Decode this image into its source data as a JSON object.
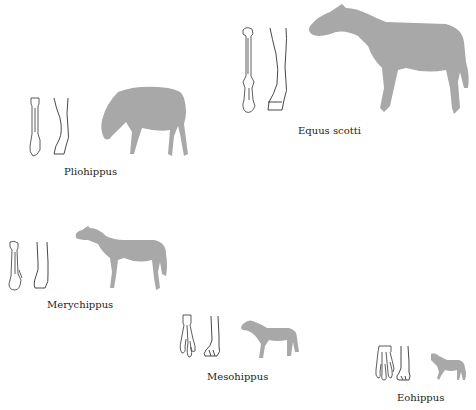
{
  "figure": {
    "title": "",
    "colors": {
      "silhouette": "#a8a8a8",
      "line": "#333333",
      "background": "#ffffff"
    },
    "species": [
      {
        "name": "Equus scotti",
        "icon": "horse-silhouette-icon"
      },
      {
        "name": "Pliohippus",
        "icon": "grazing-horse-icon"
      },
      {
        "name": "Merychippus",
        "icon": "horse-silhouette-icon"
      },
      {
        "name": "Mesohippus",
        "icon": "small-horse-icon"
      },
      {
        "name": "Eohippus",
        "icon": "dawn-horse-icon"
      }
    ]
  }
}
